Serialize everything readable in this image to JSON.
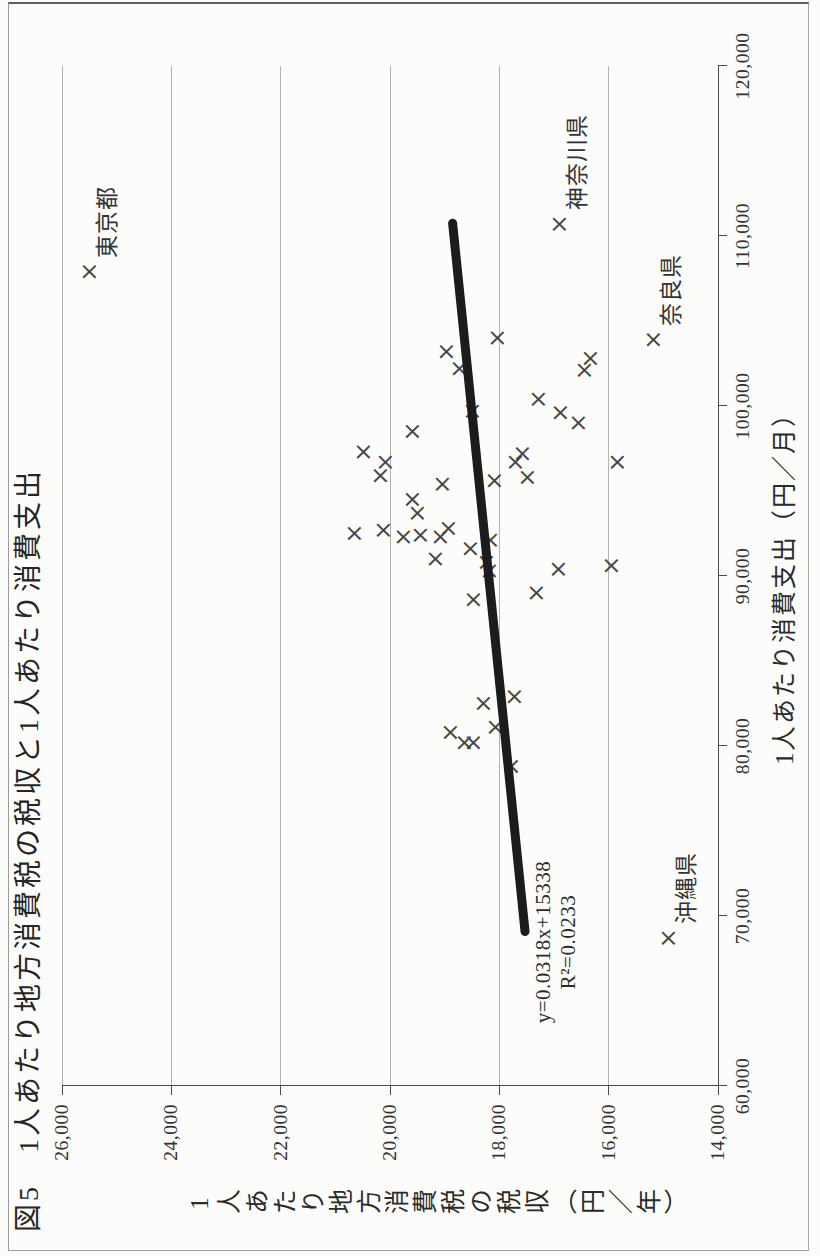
{
  "chart_data": {
    "type": "scatter",
    "title": "図5　1人あたり地方消費税の税収と1人あたり消費支出",
    "xlabel": "1人あたり消費支出（円／月）",
    "ylabel": "1人あたり地方消費税の税収（円／年）",
    "xlim": [
      60000,
      120000
    ],
    "ylim": [
      14000,
      26000
    ],
    "x_tick_step": 10000,
    "y_tick_step": 2000,
    "x_ticks": [
      "60,000",
      "70,000",
      "80,000",
      "90,000",
      "100,000",
      "110,000",
      "120,000"
    ],
    "y_ticks": [
      "26,000",
      "24,000",
      "22,000",
      "20,000",
      "18,000",
      "16,000",
      "14,000"
    ],
    "grid": "y-gridlines-only",
    "legend": "none",
    "marker_glyph": "×",
    "colors": {
      "ink": "#2f2f2f",
      "grid": "#b3b3b2",
      "axis": "#4a4a4a",
      "marker": "#454545",
      "trend": "#1c1c1c"
    },
    "points": [
      {
        "x": 107900,
        "y": 25500,
        "label": "東京都"
      },
      {
        "x": 110700,
        "y": 16900,
        "label": "神奈川県"
      },
      {
        "x": 103900,
        "y": 15180,
        "label": "奈良県"
      },
      {
        "x": 68700,
        "y": 14910,
        "label": "沖縄県"
      },
      {
        "x": 104000,
        "y": 18050
      },
      {
        "x": 103200,
        "y": 18980
      },
      {
        "x": 102200,
        "y": 18740
      },
      {
        "x": 102800,
        "y": 16340
      },
      {
        "x": 102100,
        "y": 16450
      },
      {
        "x": 100400,
        "y": 17300
      },
      {
        "x": 99600,
        "y": 16890
      },
      {
        "x": 99000,
        "y": 16570
      },
      {
        "x": 99700,
        "y": 18500
      },
      {
        "x": 98500,
        "y": 19590
      },
      {
        "x": 97300,
        "y": 20500
      },
      {
        "x": 96700,
        "y": 20090
      },
      {
        "x": 95900,
        "y": 20180
      },
      {
        "x": 97200,
        "y": 17590
      },
      {
        "x": 96700,
        "y": 17710
      },
      {
        "x": 96700,
        "y": 15850
      },
      {
        "x": 95800,
        "y": 17500
      },
      {
        "x": 95600,
        "y": 18090
      },
      {
        "x": 95400,
        "y": 19040
      },
      {
        "x": 94500,
        "y": 19600
      },
      {
        "x": 93700,
        "y": 19500
      },
      {
        "x": 92800,
        "y": 18930
      },
      {
        "x": 92700,
        "y": 20130
      },
      {
        "x": 92500,
        "y": 20660
      },
      {
        "x": 92300,
        "y": 19770
      },
      {
        "x": 92400,
        "y": 19460
      },
      {
        "x": 92300,
        "y": 19090
      },
      {
        "x": 91600,
        "y": 18540
      },
      {
        "x": 92100,
        "y": 18170
      },
      {
        "x": 91000,
        "y": 19180
      },
      {
        "x": 90800,
        "y": 18240
      },
      {
        "x": 90300,
        "y": 18190
      },
      {
        "x": 90400,
        "y": 16920
      },
      {
        "x": 90600,
        "y": 15960
      },
      {
        "x": 89000,
        "y": 17330
      },
      {
        "x": 88600,
        "y": 18480
      },
      {
        "x": 82500,
        "y": 18290
      },
      {
        "x": 82900,
        "y": 17740
      },
      {
        "x": 80800,
        "y": 18900
      },
      {
        "x": 80200,
        "y": 18650
      },
      {
        "x": 80200,
        "y": 18480
      },
      {
        "x": 81100,
        "y": 18080
      },
      {
        "x": 78800,
        "y": 17790
      }
    ],
    "trendline": {
      "slope": 0.0318,
      "intercept": 15338,
      "x_start": 68800,
      "x_end": 111000,
      "equation": "y=0.0318x+15338",
      "r_squared": "R²=0.0233"
    }
  }
}
